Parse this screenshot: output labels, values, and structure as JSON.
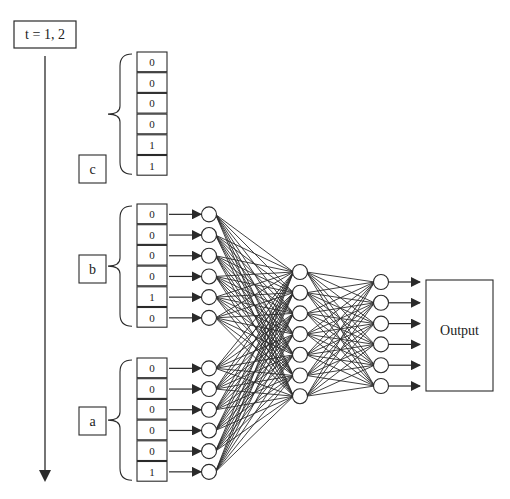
{
  "time_label": "t = 1, 2",
  "output_label": "Output",
  "groups": [
    {
      "name": "c",
      "values": [
        "0",
        "0",
        "0",
        "0",
        "1",
        "1"
      ],
      "connected": false
    },
    {
      "name": "b",
      "values": [
        "0",
        "0",
        "0",
        "0",
        "1",
        "0"
      ],
      "connected": true
    },
    {
      "name": "a",
      "values": [
        "0",
        "0",
        "0",
        "0",
        "0",
        "1"
      ],
      "connected": true
    }
  ],
  "layers": {
    "hidden1_count": 7,
    "hidden2_count": 6,
    "output_arrows": 6
  },
  "colors": {
    "line": "#2a2a2a",
    "node_fill": "#ffffff"
  }
}
